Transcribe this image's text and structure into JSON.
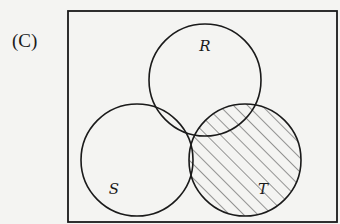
{
  "option_label": "(C)",
  "diagram": {
    "type": "venn",
    "universe": {
      "x": 68,
      "y": 11,
      "w": 269,
      "h": 211
    },
    "sets": [
      {
        "name": "R",
        "cx": 205,
        "cy": 80,
        "r": 56,
        "label_x": 205,
        "label_y": 51
      },
      {
        "name": "S",
        "cx": 137,
        "cy": 160,
        "r": 56,
        "label_x": 114,
        "label_y": 194
      },
      {
        "name": "T",
        "cx": 245,
        "cy": 160,
        "r": 56,
        "label_x": 263,
        "label_y": 194
      }
    ],
    "shaded_region": "T",
    "stroke_color": "#1a1a1a",
    "background_color": "#f4f4f2"
  }
}
